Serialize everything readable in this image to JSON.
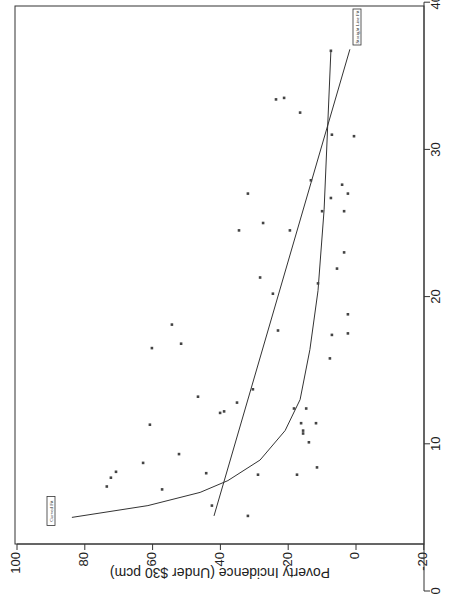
{
  "chart_data": {
    "type": "scatter",
    "orientation": "rotated-90-clockwise",
    "title": "",
    "xlabel": "",
    "ylabel": "Poverty Incidence (Under $30 pcm)",
    "xlim": [
      0,
      40
    ],
    "ylim": [
      -20,
      100
    ],
    "x_ticks": [
      0,
      10,
      20,
      30,
      40
    ],
    "y_ticks": [
      -20,
      0,
      20,
      40,
      60,
      80,
      100
    ],
    "grid": false,
    "points": [
      {
        "x": 36.7,
        "y": 7.4
      },
      {
        "x": 33.4,
        "y": 23.6
      },
      {
        "x": 33.5,
        "y": 21.2
      },
      {
        "x": 32.5,
        "y": 16.5
      },
      {
        "x": 31.0,
        "y": 7.1
      },
      {
        "x": 30.9,
        "y": 0.6
      },
      {
        "x": 27.9,
        "y": 13.3
      },
      {
        "x": 27.6,
        "y": 4.1
      },
      {
        "x": 27.0,
        "y": 2.4
      },
      {
        "x": 26.7,
        "y": 7.4
      },
      {
        "x": 25.8,
        "y": 10.0
      },
      {
        "x": 25.8,
        "y": 3.5
      },
      {
        "x": 27.0,
        "y": 31.9
      },
      {
        "x": 25.0,
        "y": 27.4
      },
      {
        "x": 24.5,
        "y": 34.5
      },
      {
        "x": 24.5,
        "y": 19.5
      },
      {
        "x": 23.0,
        "y": 3.5
      },
      {
        "x": 21.9,
        "y": 5.6
      },
      {
        "x": 21.3,
        "y": 28.3
      },
      {
        "x": 20.9,
        "y": 11.2
      },
      {
        "x": 20.2,
        "y": 24.5
      },
      {
        "x": 18.1,
        "y": 54.3
      },
      {
        "x": 16.8,
        "y": 51.6
      },
      {
        "x": 16.5,
        "y": 60.2
      },
      {
        "x": 17.7,
        "y": 23.0
      },
      {
        "x": 18.8,
        "y": 2.4
      },
      {
        "x": 17.4,
        "y": 7.1
      },
      {
        "x": 17.5,
        "y": 2.4
      },
      {
        "x": 15.8,
        "y": 7.7
      },
      {
        "x": 13.7,
        "y": 30.4
      },
      {
        "x": 13.2,
        "y": 46.6
      },
      {
        "x": 12.8,
        "y": 35.1
      },
      {
        "x": 12.1,
        "y": 40.1
      },
      {
        "x": 12.2,
        "y": 38.9
      },
      {
        "x": 11.3,
        "y": 60.8
      },
      {
        "x": 12.4,
        "y": 18.3
      },
      {
        "x": 12.4,
        "y": 14.7
      },
      {
        "x": 11.4,
        "y": 16.2
      },
      {
        "x": 11.4,
        "y": 11.8
      },
      {
        "x": 10.9,
        "y": 15.6
      },
      {
        "x": 10.7,
        "y": 15.6
      },
      {
        "x": 10.1,
        "y": 13.9
      },
      {
        "x": 8.7,
        "y": 62.8
      },
      {
        "x": 9.3,
        "y": 52.2
      },
      {
        "x": 8.1,
        "y": 70.8
      },
      {
        "x": 7.7,
        "y": 72.3
      },
      {
        "x": 7.1,
        "y": 73.5
      },
      {
        "x": 6.9,
        "y": 57.2
      },
      {
        "x": 8.0,
        "y": 44.2
      },
      {
        "x": 7.9,
        "y": 28.9
      },
      {
        "x": 7.9,
        "y": 17.4
      },
      {
        "x": 8.4,
        "y": 11.5
      },
      {
        "x": 5.8,
        "y": 42.5
      },
      {
        "x": 5.1,
        "y": 31.9
      }
    ],
    "series": [
      {
        "name": "Straight Line Fit",
        "type": "line",
        "label": "Straight Line Fit",
        "values": [
          {
            "x": 5.1,
            "y": 41.9
          },
          {
            "x": 36.8,
            "y": 1.8
          }
        ]
      },
      {
        "name": "Curved Fit",
        "type": "line",
        "label": "Curved Fit",
        "values": [
          {
            "x": 5.0,
            "y": 83.8
          },
          {
            "x": 5.8,
            "y": 61.4
          },
          {
            "x": 6.7,
            "y": 46.0
          },
          {
            "x": 7.5,
            "y": 37.8
          },
          {
            "x": 8.9,
            "y": 28.3
          },
          {
            "x": 10.9,
            "y": 20.9
          },
          {
            "x": 13.0,
            "y": 16.5
          },
          {
            "x": 16.4,
            "y": 13.6
          },
          {
            "x": 20.4,
            "y": 11.2
          },
          {
            "x": 25.9,
            "y": 9.4
          },
          {
            "x": 36.7,
            "y": 7.4
          }
        ]
      }
    ],
    "annotations": [
      {
        "text": "Straight Line Fit",
        "near": "top-right end of straight line"
      },
      {
        "text": "Curved Fit",
        "near": "upper-left start of curved fit"
      }
    ]
  },
  "labels": {
    "y_axis_title": "Poverty Incidence (Under $30 pcm)",
    "straight_fit": "Straight Line Fit",
    "curved_fit": "Curved Fit"
  }
}
